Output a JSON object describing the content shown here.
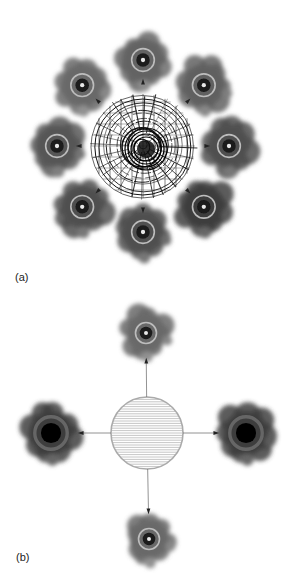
{
  "figure": {
    "panels": [
      {
        "label": "(a)",
        "center_element": "polar-grid-circle",
        "center": [
          143,
          146
        ],
        "center_radius": 52,
        "blob_orbit_radius": 86,
        "blobs": [
          {
            "id": "top",
            "angle": -90,
            "core": "small-dot",
            "darkness": 0.72
          },
          {
            "id": "top-right",
            "angle": -45,
            "core": "small-dot",
            "darkness": 0.74
          },
          {
            "id": "right",
            "angle": 0,
            "core": "small-dot",
            "darkness": 0.82
          },
          {
            "id": "bottom-right",
            "angle": 45,
            "core": "small-dot",
            "darkness": 0.9
          },
          {
            "id": "bottom",
            "angle": 90,
            "core": "small-dot",
            "darkness": 0.82
          },
          {
            "id": "bottom-left",
            "angle": 135,
            "core": "small-dot",
            "darkness": 0.82
          },
          {
            "id": "left",
            "angle": 180,
            "core": "small-dot",
            "darkness": 0.78
          },
          {
            "id": "top-left",
            "angle": -135,
            "core": "small-dot",
            "darkness": 0.7
          }
        ],
        "arrow_style": "arrowhead-only"
      },
      {
        "label": "(b)",
        "center_element": "hatched-circle",
        "center": [
          147,
          143
        ],
        "center_radius": 36,
        "blobs": [
          {
            "id": "top",
            "pos": [
              146,
              43
            ],
            "core": "small-dot",
            "darkness": 0.7
          },
          {
            "id": "right",
            "pos": [
              246,
              143
            ],
            "core": "large-black",
            "darkness": 0.9
          },
          {
            "id": "bottom",
            "pos": [
              149,
              249
            ],
            "core": "small-dot",
            "darkness": 0.7
          },
          {
            "id": "left",
            "pos": [
              51,
              143
            ],
            "core": "large-black",
            "darkness": 0.9
          }
        ],
        "arrow_style": "line-with-arrowhead"
      }
    ]
  },
  "colors": {
    "background": "#ffffff",
    "ink": "#111111",
    "blob": "#3a3a3a",
    "hatch": "#b8b8b8"
  }
}
